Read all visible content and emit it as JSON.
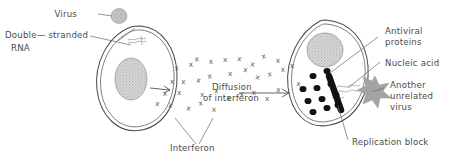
{
  "figure": {
    "type": "biology-diagram",
    "background_color": "#ffffff",
    "ink_color": "#4a4a4a"
  },
  "labels": {
    "virus": "Virus",
    "double_stranded_rna_line1": "Double— stranded",
    "double_stranded_rna_line2": "RNA",
    "diffusion_line1": "Diffusion",
    "diffusion_line2": "of interferon",
    "interferon": "Interferon",
    "antiviral_proteins_line1": "Antiviral",
    "antiviral_proteins_line2": "proteins",
    "nucleic_acid": "Nucleic acid",
    "another_unrelated_virus_line1": "Another",
    "another_unrelated_virus_line2": "unrelated",
    "another_unrelated_virus_line3": "virus",
    "replication_block": "Replication block"
  },
  "markers": {
    "interferon_symbol": "x",
    "interferon_symbol_name": "interferon-x-marker",
    "interferon_count": 34
  },
  "cells": {
    "left": {
      "name": "infected-cell",
      "nucleus_color": "#b9b9b9",
      "membrane_color": "#4d4d4d"
    },
    "right": {
      "name": "interferon-protected-cell",
      "nucleus_color": "#b9b9b9",
      "antiviral_protein_color": "#121212",
      "unrelated_virus_color": "#9e9e9e"
    }
  },
  "icons": {
    "virus_particle": "virus-blob-icon",
    "star_virus": "star-virus-icon",
    "arrow": "arrow-right-icon",
    "rna_squiggle": "rna-squiggle-icon"
  },
  "interferon_positions": [
    [
      175,
      71
    ],
    [
      189,
      67
    ],
    [
      170,
      84
    ],
    [
      181,
      84
    ],
    [
      196,
      82
    ],
    [
      208,
      79
    ],
    [
      163,
      96
    ],
    [
      177,
      95
    ],
    [
      155,
      106
    ],
    [
      168,
      107
    ],
    [
      195,
      62
    ],
    [
      209,
      64
    ],
    [
      223,
      62
    ],
    [
      237,
      61
    ],
    [
      250,
      66
    ],
    [
      262,
      59
    ],
    [
      276,
      63
    ],
    [
      228,
      76
    ],
    [
      243,
      72
    ],
    [
      255,
      79
    ],
    [
      268,
      77
    ],
    [
      281,
      72
    ],
    [
      200,
      97
    ],
    [
      214,
      93
    ],
    [
      226,
      100
    ],
    [
      240,
      97
    ],
    [
      252,
      95
    ],
    [
      265,
      101
    ],
    [
      276,
      92
    ],
    [
      186,
      110
    ],
    [
      199,
      106
    ],
    [
      212,
      112
    ],
    [
      290,
      68
    ],
    [
      296,
      86
    ]
  ],
  "antiviral_protein_positions": [
    [
      313,
      76
    ],
    [
      327,
      71
    ],
    [
      303,
      89
    ],
    [
      317,
      88
    ],
    [
      331,
      84
    ],
    [
      308,
      101
    ],
    [
      322,
      99
    ],
    [
      336,
      95
    ],
    [
      313,
      112
    ],
    [
      327,
      108
    ],
    [
      338,
      105
    ]
  ]
}
